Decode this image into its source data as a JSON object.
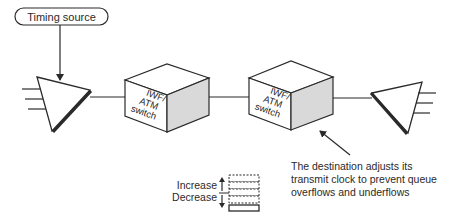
{
  "diagram": {
    "timing_source": {
      "label": "Timing source"
    },
    "switch_left": {
      "label_lines": [
        "IWF/",
        "ATM",
        "switch"
      ]
    },
    "switch_right": {
      "label_lines": [
        "IWF/",
        "ATM",
        "switch"
      ]
    },
    "annotation": {
      "lines": [
        "The destination adjusts its",
        "transmit clock to prevent queue",
        "overflows and underflows"
      ]
    },
    "legend": {
      "increase_label": "Increase",
      "decrease_label": "Decrease",
      "buffer_slots_dashed": 4,
      "buffer_slots_solid": 1
    },
    "colors": {
      "stroke": "#2a2a2a",
      "box_side_fill": "#d9d9d9",
      "background": "#ffffff"
    }
  }
}
